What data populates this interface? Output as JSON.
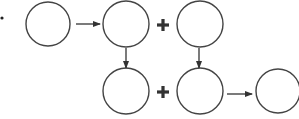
{
  "diagram": {
    "stroke_color": "#444444",
    "bullet": {
      "cx": 2,
      "cy": 18,
      "r": 1.6
    },
    "circles": [
      {
        "id": "c1",
        "cx": 48,
        "cy": 24,
        "r": 22,
        "label": ""
      },
      {
        "id": "c2",
        "cx": 126,
        "cy": 24,
        "r": 23,
        "label": ""
      },
      {
        "id": "c3",
        "cx": 200,
        "cy": 24,
        "r": 23,
        "label": ""
      },
      {
        "id": "c4",
        "cx": 126,
        "cy": 91,
        "r": 23,
        "label": ""
      },
      {
        "id": "c5",
        "cx": 200,
        "cy": 91,
        "r": 23,
        "label": ""
      },
      {
        "id": "c6",
        "cx": 278,
        "cy": 91,
        "r": 22,
        "label": ""
      }
    ],
    "plus_signs": [
      {
        "x": 163,
        "y": 25,
        "symbol": "+"
      },
      {
        "x": 163,
        "y": 92,
        "symbol": "+"
      }
    ],
    "arrows": [
      {
        "from": "c1",
        "to": "c2",
        "x1": 76,
        "y1": 24,
        "x2": 100,
        "y2": 24
      },
      {
        "from": "c2",
        "to": "c4",
        "x1": 126,
        "y1": 48,
        "x2": 126,
        "y2": 68
      },
      {
        "from": "c3",
        "to": "c5",
        "x1": 199,
        "y1": 48,
        "x2": 199,
        "y2": 68
      },
      {
        "from": "c5",
        "to": "c6",
        "x1": 227,
        "y1": 94,
        "x2": 252,
        "y2": 94
      }
    ]
  }
}
